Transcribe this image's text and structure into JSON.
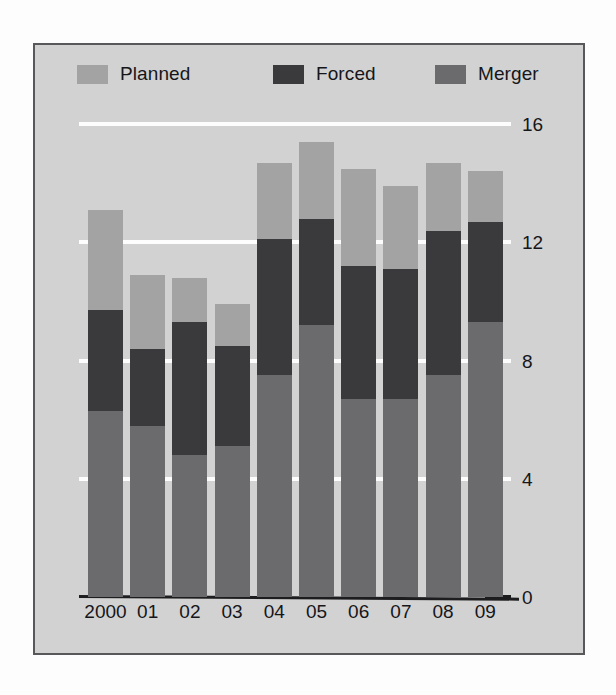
{
  "legend": {
    "items": [
      {
        "label": "Planned",
        "color": "#a3a3a3",
        "name": "planned"
      },
      {
        "label": "Forced",
        "color": "#3a3a3c",
        "name": "forced"
      },
      {
        "label": "Merger",
        "color": "#6b6b6d",
        "name": "merger"
      }
    ]
  },
  "axis": {
    "y_ticks": [
      "0",
      "4",
      "8",
      "12",
      "16"
    ],
    "x_labels": [
      "2000",
      "01",
      "02",
      "03",
      "04",
      "05",
      "06",
      "07",
      "08",
      "09"
    ]
  },
  "colors": {
    "panel_background": "#d2d2d2",
    "page_background": "#fdfdfd",
    "panel_border": "#58585a",
    "gridline": "#fdfdfd",
    "axis_line": "#1d1d1f",
    "text": "#16161a",
    "planned": "#a3a3a3",
    "forced": "#3a3a3c",
    "merger": "#6b6b6d"
  },
  "chart_data": {
    "type": "bar",
    "subtype": "stacked",
    "title": "",
    "xlabel": "",
    "ylabel": "",
    "ylim": [
      0,
      16
    ],
    "ytick_step": 4,
    "grid": true,
    "legend_position": "top",
    "stack_order_bottom_to_top": [
      "Merger",
      "Forced",
      "Planned"
    ],
    "categories": [
      "2000",
      "01",
      "02",
      "03",
      "04",
      "05",
      "06",
      "07",
      "08",
      "09"
    ],
    "series": [
      {
        "name": "Merger",
        "color": "#6b6b6d",
        "values": [
          6.3,
          5.8,
          4.8,
          5.1,
          7.5,
          9.2,
          6.7,
          6.7,
          7.5,
          9.3
        ]
      },
      {
        "name": "Forced",
        "color": "#3a3a3c",
        "values": [
          3.4,
          2.6,
          4.5,
          3.4,
          4.6,
          3.6,
          4.5,
          4.4,
          4.9,
          3.4
        ]
      },
      {
        "name": "Planned",
        "color": "#a3a3a3",
        "values": [
          3.4,
          2.5,
          1.5,
          1.4,
          2.6,
          2.6,
          3.3,
          2.8,
          2.3,
          1.7
        ]
      }
    ],
    "totals": [
      13.1,
      10.9,
      10.8,
      9.9,
      14.7,
      15.4,
      14.6,
      13.9,
      14.6,
      14.3
    ]
  }
}
